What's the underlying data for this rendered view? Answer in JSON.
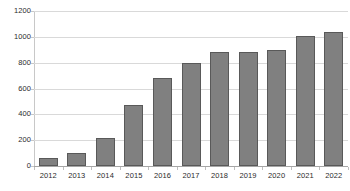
{
  "chart_data": {
    "type": "bar",
    "title": "",
    "subtitle": "",
    "xlabel": "",
    "ylabel": "",
    "categories": [
      "2012",
      "2013",
      "2014",
      "2015",
      "2016",
      "2017",
      "2018",
      "2019",
      "2020",
      "2021",
      "2022"
    ],
    "values": [
      60,
      100,
      220,
      470,
      680,
      800,
      880,
      885,
      895,
      1010,
      1040
    ],
    "ylim": [
      0,
      1200
    ],
    "ytick_labels": [
      "0",
      "200",
      "400",
      "600",
      "800",
      "1000",
      "1200"
    ],
    "ytick_values": [
      0,
      200,
      400,
      600,
      800,
      1000,
      1200
    ],
    "grid": true,
    "legend": false,
    "legend_position": "none",
    "series": [
      {
        "name": "",
        "values": [
          60,
          100,
          220,
          470,
          680,
          800,
          880,
          885,
          895,
          1010,
          1040
        ]
      }
    ]
  },
  "style": {
    "bar_fill": "#808080",
    "bar_border": "#595959",
    "gridline_color": "#d9d9d9",
    "axis_color": "#a6a6a6",
    "text_color": "#2b2b2b",
    "background": "#ffffff"
  }
}
